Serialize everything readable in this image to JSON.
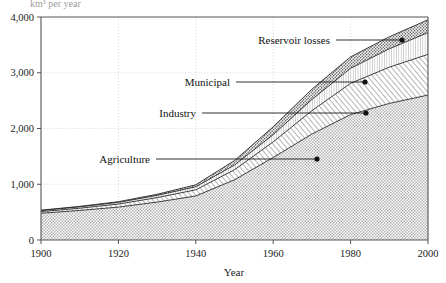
{
  "chart_data": {
    "type": "area",
    "title": "",
    "unit_label": "km³ per year",
    "xlabel": "Year",
    "ylabel": "",
    "xlim": [
      1900,
      2000
    ],
    "ylim": [
      0,
      4000
    ],
    "xticks": [
      1900,
      1920,
      1940,
      1960,
      1980,
      2000
    ],
    "xtick_labels": [
      "1900",
      "1920",
      "1940",
      "1960",
      "1980",
      "2000"
    ],
    "yticks": [
      0,
      1000,
      2000,
      3000,
      4000
    ],
    "ytick_labels": [
      "0",
      "1,000",
      "2,000",
      "3,000",
      "4,000"
    ],
    "grid": "dotted",
    "stacked": true,
    "legend_position": "inline-annotations",
    "x": [
      1900,
      1910,
      1920,
      1930,
      1940,
      1950,
      1960,
      1970,
      1980,
      1990,
      2000
    ],
    "series": [
      {
        "name": "Agriculture",
        "fill": "checker",
        "values": [
          480,
          530,
          590,
          680,
          790,
          1080,
          1480,
          1900,
          2250,
          2450,
          2600
        ]
      },
      {
        "name": "Industry",
        "fill": "diagonal-hatch",
        "values": [
          30,
          40,
          55,
          80,
          110,
          180,
          280,
          420,
          560,
          650,
          730
        ]
      },
      {
        "name": "Municipal",
        "fill": "vertical-hatch",
        "values": [
          20,
          25,
          30,
          40,
          55,
          85,
          130,
          200,
          270,
          330,
          390
        ]
      },
      {
        "name": "Reservoir losses",
        "fill": "stipple",
        "values": [
          5,
          8,
          12,
          20,
          35,
          80,
          140,
          185,
          205,
          215,
          230
        ]
      }
    ],
    "cumulative_totals": [
      535,
      603,
      687,
      820,
      990,
      1425,
      2030,
      2705,
      3285,
      3645,
      3950
    ],
    "annotations": [
      {
        "label": "Agriculture",
        "text_x": 150,
        "text_y": 159,
        "dot_x": 317,
        "dot_y": 159
      },
      {
        "label": "Industry",
        "text_x": 196,
        "text_y": 113,
        "dot_x": 366,
        "dot_y": 113
      },
      {
        "label": "Municipal",
        "text_x": 230,
        "text_y": 82,
        "dot_x": 365,
        "dot_y": 82
      },
      {
        "label": "Reservoir losses",
        "text_x": 330,
        "text_y": 40,
        "dot_x": 402,
        "dot_y": 40
      }
    ]
  }
}
